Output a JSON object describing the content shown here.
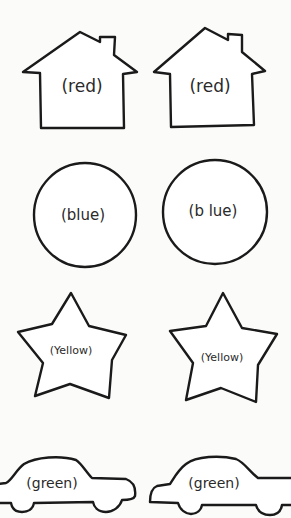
{
  "sheet": {
    "background": "#fbfbfa",
    "stroke_color": "#1a1a1a",
    "shapes": [
      {
        "type": "house",
        "position": "row-1-left",
        "label": "(red)"
      },
      {
        "type": "house",
        "position": "row-1-right",
        "label": "(red)"
      },
      {
        "type": "circle",
        "position": "row-2-left",
        "label": "(blue)"
      },
      {
        "type": "circle",
        "position": "row-2-right",
        "label": "(b lue)"
      },
      {
        "type": "star",
        "position": "row-3-left",
        "label": "(Yellow)"
      },
      {
        "type": "star",
        "position": "row-3-right",
        "label": "(Yellow)"
      },
      {
        "type": "car",
        "position": "row-4-left",
        "label": "(green)"
      },
      {
        "type": "car",
        "position": "row-4-right",
        "label": "(green)"
      }
    ]
  }
}
